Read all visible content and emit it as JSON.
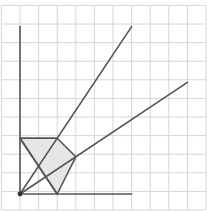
{
  "diagram": {
    "type": "geometry-grid",
    "grid": {
      "cols": 11,
      "rows": 11,
      "spacing_px": 18.6,
      "left_px": 1.4,
      "top_px": 5.4,
      "color": "#d6d6d6"
    },
    "origin_px": [
      20,
      194
    ],
    "unit_px": 18.6,
    "colors": {
      "line": "#555555",
      "shade": "#e6e6e6",
      "grid": "#d6d6d6"
    },
    "axes": {
      "y_axis": {
        "from": [
          0,
          0
        ],
        "to": [
          0,
          9
        ]
      },
      "x_axis": {
        "from": [
          0,
          0
        ],
        "to": [
          6,
          0
        ]
      }
    },
    "rays": [
      {
        "name": "steep-ray",
        "from": [
          0,
          0
        ],
        "to": [
          6,
          9
        ]
      },
      {
        "name": "shallow-ray",
        "from": [
          0,
          0
        ],
        "to": [
          9,
          6
        ]
      }
    ],
    "shaded_polygon": [
      [
        0,
        3
      ],
      [
        2,
        3
      ],
      [
        3,
        2
      ],
      [
        2,
        0
      ]
    ],
    "extra_segments": [
      {
        "name": "diagonal-segment",
        "from": [
          0,
          3
        ],
        "to": [
          2,
          0
        ]
      }
    ],
    "origin_point": [
      0,
      0
    ]
  }
}
